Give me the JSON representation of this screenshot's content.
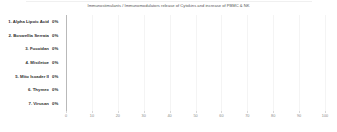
{
  "chart_data": {
    "type": "bar",
    "orientation": "horizontal",
    "title": "Immunostimulants / Immunomodulators release of Cytokins and increase of PBMC & NK",
    "xlabel": "",
    "ylabel": "",
    "xlim": [
      0,
      100
    ],
    "xticks": [
      0,
      10,
      20,
      30,
      40,
      50,
      60,
      70,
      80,
      90,
      100
    ],
    "xtick_labels": [
      "0",
      "10",
      "20",
      "30",
      "40",
      "50",
      "60",
      "70",
      "80",
      "90",
      "100"
    ],
    "grid": true,
    "grid_axis": "x",
    "legend": false,
    "categories": [
      "1. Alpha Lipoic Acid",
      "2. Boswellia Serrata",
      "3. Fucoidan",
      "4. Mistletoe",
      "5. Mito Isoader II",
      "6. Thymex",
      "7. Virusan"
    ],
    "values": [
      0,
      0,
      0,
      0,
      0,
      0,
      0
    ],
    "data_labels": [
      "0%",
      "0%",
      "0%",
      "0%",
      "0%",
      "0%",
      "0%"
    ],
    "bar_color": "#4e79a7",
    "grid_color": "#f4f4f4",
    "axis_color": "#b9b9b9",
    "title_color": "#555555",
    "label_color": "#2e2e2e",
    "tick_label_color": "#8a8a8a"
  }
}
